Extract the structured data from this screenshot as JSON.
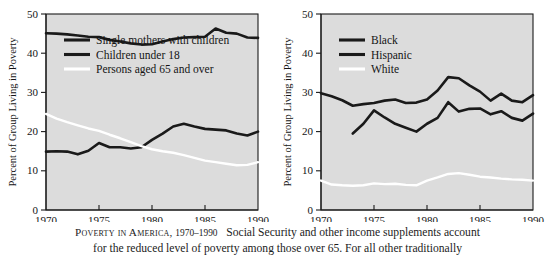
{
  "caption": {
    "lead": "Poverty in America,",
    "years": "1970–1990",
    "body": "Social Security and other income supplements account",
    "line2": "for the reduced level of poverty among those over 65. For all other traditionally"
  },
  "colors": {
    "plot_background": "#dcdcdc",
    "axis": "#1b1b1b",
    "dark_series": "#1a1a1a",
    "white_series": "#ffffff",
    "page_background": "#ffffff"
  },
  "chart_data": [
    {
      "type": "line",
      "panel": "left",
      "title": "",
      "xlabel": "",
      "ylabel": "Percent of Group Living in Poverty",
      "xlim": [
        1970,
        1990
      ],
      "ylim": [
        0,
        50
      ],
      "xticks": [
        1970,
        1975,
        1980,
        1985,
        1990
      ],
      "yticks": [
        0,
        10,
        20,
        30,
        40,
        50
      ],
      "xticklabels": [
        "1970",
        "1975",
        "1980",
        "1985",
        "1990"
      ],
      "yticklabels": [
        "0",
        "10",
        "20",
        "30",
        "40",
        "50"
      ],
      "grid": false,
      "legend_position": "upper-left-inside",
      "series": [
        {
          "name": "Single mothers with children",
          "color": "#1a1a1a",
          "x": [
            1970,
            1971,
            1972,
            1973,
            1974,
            1975,
            1976,
            1977,
            1978,
            1979,
            1980,
            1981,
            1982,
            1983,
            1984,
            1985,
            1986,
            1987,
            1988,
            1989,
            1990
          ],
          "values": [
            45.1,
            45.0,
            44.8,
            44.5,
            44.2,
            44.1,
            43.4,
            43.0,
            42.5,
            42.2,
            42.3,
            43.0,
            43.6,
            44.0,
            44.1,
            44.2,
            46.3,
            45.2,
            45.0,
            44.0,
            43.9
          ]
        },
        {
          "name": "Children under 18",
          "color": "#1a1a1a",
          "x": [
            1970,
            1971,
            1972,
            1973,
            1974,
            1975,
            1976,
            1977,
            1978,
            1979,
            1980,
            1981,
            1982,
            1983,
            1984,
            1985,
            1986,
            1987,
            1988,
            1989,
            1990
          ],
          "values": [
            14.9,
            15.0,
            14.9,
            14.2,
            15.1,
            17.1,
            16.0,
            16.0,
            15.7,
            16.0,
            17.9,
            19.5,
            21.3,
            22.0,
            21.3,
            20.7,
            20.5,
            20.3,
            19.5,
            19.0,
            20.0
          ]
        },
        {
          "name": "Persons aged 65 and over",
          "color": "#ffffff",
          "x": [
            1970,
            1971,
            1972,
            1973,
            1974,
            1975,
            1976,
            1977,
            1978,
            1979,
            1980,
            1981,
            1982,
            1983,
            1984,
            1985,
            1986,
            1987,
            1988,
            1989,
            1990
          ],
          "values": [
            24.5,
            23.3,
            22.4,
            21.6,
            20.8,
            20.2,
            19.2,
            18.3,
            17.3,
            16.3,
            15.5,
            15.0,
            14.6,
            14.0,
            13.3,
            12.6,
            12.2,
            11.8,
            11.4,
            11.5,
            12.2
          ]
        }
      ]
    },
    {
      "type": "line",
      "panel": "right",
      "title": "",
      "xlabel": "",
      "ylabel": "Percent of Group Living in Poverty",
      "xlim": [
        1970,
        1990
      ],
      "ylim": [
        0,
        50
      ],
      "xticks": [
        1970,
        1975,
        1980,
        1985,
        1990
      ],
      "yticks": [
        0,
        10,
        20,
        30,
        40,
        50
      ],
      "xticklabels": [
        "1970",
        "1975",
        "1980",
        "1985",
        "1990"
      ],
      "yticklabels": [
        "0",
        "10",
        "20",
        "30",
        "40",
        "50"
      ],
      "grid": false,
      "legend_position": "upper-left-inside",
      "series": [
        {
          "name": "Black",
          "color": "#1a1a1a",
          "x": [
            1970,
            1971,
            1972,
            1973,
            1974,
            1975,
            1976,
            1977,
            1978,
            1979,
            1980,
            1981,
            1982,
            1983,
            1984,
            1985,
            1986,
            1987,
            1988,
            1989,
            1990
          ],
          "values": [
            29.8,
            29.0,
            28.0,
            26.6,
            27.0,
            27.3,
            27.9,
            28.2,
            27.3,
            27.4,
            28.2,
            30.5,
            33.9,
            33.6,
            31.8,
            30.2,
            27.9,
            29.7,
            27.9,
            27.5,
            29.3
          ]
        },
        {
          "name": "Hispanic",
          "color": "#1a1a1a",
          "x": [
            1973,
            1974,
            1975,
            1976,
            1977,
            1978,
            1979,
            1980,
            1981,
            1982,
            1983,
            1984,
            1985,
            1986,
            1987,
            1988,
            1989,
            1990
          ],
          "values": [
            19.5,
            22.0,
            25.4,
            23.6,
            22.0,
            21.0,
            20.0,
            22.0,
            23.5,
            27.5,
            25.1,
            25.8,
            25.9,
            24.4,
            25.2,
            23.5,
            22.8,
            24.6
          ]
        },
        {
          "name": "White",
          "color": "#ffffff",
          "x": [
            1970,
            1971,
            1972,
            1973,
            1974,
            1975,
            1976,
            1977,
            1978,
            1979,
            1980,
            1981,
            1982,
            1983,
            1984,
            1985,
            1986,
            1987,
            1988,
            1989,
            1990
          ],
          "values": [
            7.5,
            6.5,
            6.3,
            6.2,
            6.3,
            6.8,
            6.6,
            6.7,
            6.4,
            6.3,
            7.5,
            8.3,
            9.2,
            9.4,
            9.0,
            8.5,
            8.3,
            8.0,
            7.8,
            7.7,
            7.5
          ]
        }
      ]
    }
  ],
  "panels": [
    {
      "key": "left",
      "legend": [
        {
          "label": "Single mothers with children",
          "swatch": "dark"
        },
        {
          "label": "Children under 18",
          "swatch": "dark"
        },
        {
          "label": "Persons aged 65 and over",
          "swatch": "white"
        }
      ]
    },
    {
      "key": "right",
      "legend": [
        {
          "label": "Black",
          "swatch": "dark"
        },
        {
          "label": "Hispanic",
          "swatch": "dark"
        },
        {
          "label": "White",
          "swatch": "white"
        }
      ]
    }
  ]
}
